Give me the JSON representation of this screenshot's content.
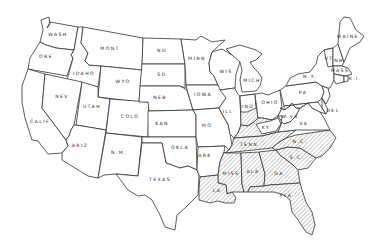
{
  "map": {
    "title": "United States map with hatched southeastern region",
    "hatch_color": "#888888",
    "line_color": "#333333",
    "background": "#ffffff",
    "states": [
      {
        "id": "wa",
        "label": "WASH",
        "x": 58,
        "y": 36,
        "hatched": false
      },
      {
        "id": "or",
        "label": "ORE",
        "x": 46,
        "y": 58,
        "hatched": false
      },
      {
        "id": "ca",
        "label": "CALIF",
        "x": 40,
        "y": 123,
        "hatched": false
      },
      {
        "id": "id",
        "label": "IDAHO",
        "x": 84,
        "y": 75,
        "hatched": false
      },
      {
        "id": "nv",
        "label": "NEV",
        "x": 62,
        "y": 98,
        "hatched": false
      },
      {
        "id": "mt",
        "label": "MONT",
        "x": 110,
        "y": 50,
        "hatched": false
      },
      {
        "id": "wy",
        "label": "WYO",
        "x": 123,
        "y": 83,
        "hatched": false
      },
      {
        "id": "ut",
        "label": "UTAH",
        "x": 92,
        "y": 108,
        "hatched": false
      },
      {
        "id": "az",
        "label": "ARIZ",
        "x": 80,
        "y": 147,
        "hatched": false
      },
      {
        "id": "co",
        "label": "COLO",
        "x": 130,
        "y": 118,
        "hatched": false
      },
      {
        "id": "nm",
        "label": "N.M.",
        "x": 119,
        "y": 154,
        "hatched": false
      },
      {
        "id": "nd",
        "label": "ND",
        "x": 162,
        "y": 52,
        "hatched": false
      },
      {
        "id": "sd",
        "label": "SD",
        "x": 162,
        "y": 76,
        "hatched": false
      },
      {
        "id": "ne",
        "label": "NEB",
        "x": 160,
        "y": 99,
        "hatched": false
      },
      {
        "id": "ks",
        "label": "KAN",
        "x": 162,
        "y": 125,
        "hatched": false
      },
      {
        "id": "ok",
        "label": "OKLA",
        "x": 180,
        "y": 149,
        "hatched": false
      },
      {
        "id": "tx",
        "label": "TEXAS",
        "x": 160,
        "y": 181,
        "hatched": false
      },
      {
        "id": "mn",
        "label": "MINN",
        "x": 197,
        "y": 60,
        "hatched": false
      },
      {
        "id": "ia",
        "label": "IOWA",
        "x": 203,
        "y": 96,
        "hatched": false
      },
      {
        "id": "mo",
        "label": "MO",
        "x": 207,
        "y": 127,
        "hatched": false
      },
      {
        "id": "ar",
        "label": "ARK",
        "x": 205,
        "y": 157,
        "hatched": false
      },
      {
        "id": "la",
        "label": "LA",
        "x": 217,
        "y": 192,
        "hatched": true
      },
      {
        "id": "wi",
        "label": "WIS",
        "x": 226,
        "y": 73,
        "hatched": false
      },
      {
        "id": "il",
        "label": "ILL",
        "x": 228,
        "y": 113,
        "hatched": false
      },
      {
        "id": "mi",
        "label": "MICH",
        "x": 258,
        "y": 82,
        "hatched": false
      },
      {
        "id": "in",
        "label": "IND",
        "x": 253,
        "y": 108,
        "hatched": false
      },
      {
        "id": "oh",
        "label": "OHIO",
        "x": 272,
        "y": 104,
        "hatched": false
      },
      {
        "id": "ky",
        "label": "KY",
        "x": 262,
        "y": 131,
        "hatched": false
      },
      {
        "id": "tn",
        "label": "TENN",
        "x": 249,
        "y": 148,
        "hatched": true
      },
      {
        "id": "ms",
        "label": "MISS",
        "x": 227,
        "y": 175,
        "hatched": true
      },
      {
        "id": "al",
        "label": "ALA",
        "x": 251,
        "y": 173,
        "hatched": true
      },
      {
        "id": "ga",
        "label": "GA",
        "x": 278,
        "y": 174,
        "hatched": true
      },
      {
        "id": "fl",
        "label": "FLA",
        "x": 287,
        "y": 198,
        "hatched": true
      },
      {
        "id": "sc",
        "label": "S.C.",
        "x": 295,
        "y": 159,
        "hatched": true
      },
      {
        "id": "nc",
        "label": "N.C.",
        "x": 296,
        "y": 143,
        "hatched": true
      },
      {
        "id": "va",
        "label": "VA",
        "x": 304,
        "y": 125,
        "hatched": false
      },
      {
        "id": "wv",
        "label": "W.VA",
        "x": 290,
        "y": 118,
        "hatched": false
      },
      {
        "id": "pa",
        "label": "PA",
        "x": 309,
        "y": 93,
        "hatched": false
      },
      {
        "id": "ny",
        "label": "N.Y.",
        "x": 311,
        "y": 75,
        "hatched": false
      },
      {
        "id": "me",
        "label": "MAINE",
        "x": 348,
        "y": 38,
        "hatched": false
      },
      {
        "id": "vt",
        "label": "VT",
        "x": 329,
        "y": 58,
        "hatched": false
      },
      {
        "id": "nh",
        "label": "NH",
        "x": 339,
        "y": 61,
        "hatched": false
      },
      {
        "id": "ma",
        "label": "MASS",
        "x": 340,
        "y": 70,
        "hatched": false
      },
      {
        "id": "ri",
        "label": "R.I.",
        "x": 353,
        "y": 79,
        "hatched": false
      },
      {
        "id": "de",
        "label": "DEL",
        "x": 331,
        "y": 112,
        "hatched": false
      }
    ]
  }
}
